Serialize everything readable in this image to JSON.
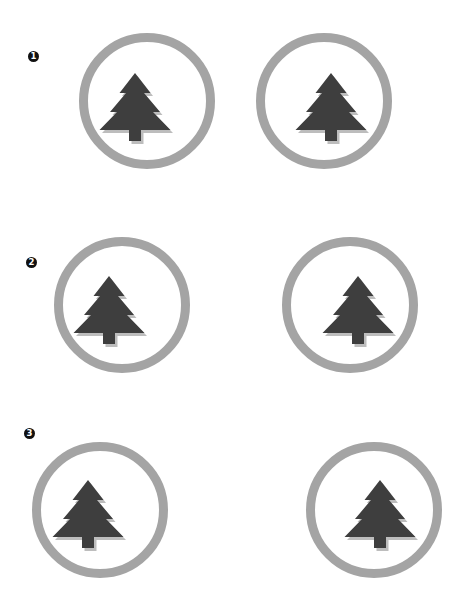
{
  "colors": {
    "background": "#ffffff",
    "ring": "#a4a4a4",
    "tree": "#3e3e3e",
    "tree_shadow": "#bdbdbd",
    "marker_bg": "#111111",
    "marker_fg": "#ffffff"
  },
  "rows": [
    {
      "marker": {
        "label": "1",
        "x": 28,
        "y": 51
      },
      "badges": [
        {
          "icon": "pine-tree-icon",
          "cx": 147,
          "cy": 101,
          "r": 68,
          "tree_apex_x": 135,
          "tree_apex_y": 73
        },
        {
          "icon": "pine-tree-icon",
          "cx": 324,
          "cy": 101,
          "r": 68,
          "tree_apex_x": 331,
          "tree_apex_y": 73
        }
      ]
    },
    {
      "marker": {
        "label": "2",
        "x": 26,
        "y": 257
      },
      "badges": [
        {
          "icon": "pine-tree-icon",
          "cx": 122,
          "cy": 305,
          "r": 68,
          "tree_apex_x": 109,
          "tree_apex_y": 276
        },
        {
          "icon": "pine-tree-icon",
          "cx": 350,
          "cy": 305,
          "r": 68,
          "tree_apex_x": 358,
          "tree_apex_y": 276
        }
      ]
    },
    {
      "marker": {
        "label": "3",
        "x": 24,
        "y": 428
      },
      "badges": [
        {
          "icon": "pine-tree-icon",
          "cx": 100,
          "cy": 510,
          "r": 68,
          "tree_apex_x": 88,
          "tree_apex_y": 480
        },
        {
          "icon": "pine-tree-icon",
          "cx": 374,
          "cy": 510,
          "r": 68,
          "tree_apex_x": 380,
          "tree_apex_y": 480
        }
      ]
    }
  ]
}
